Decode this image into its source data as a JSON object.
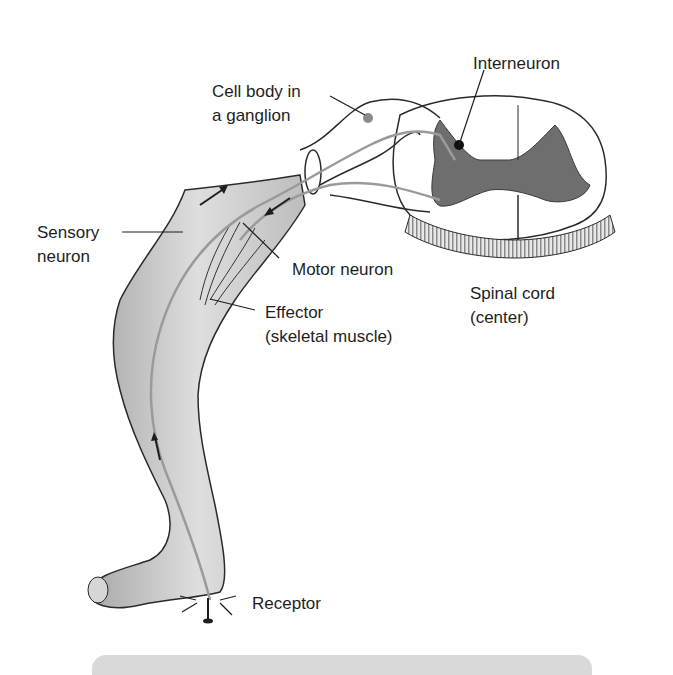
{
  "diagram": {
    "type": "reflex-arc-illustration",
    "labels": {
      "interneuron": "Interneuron",
      "cell_body_line1": "Cell body in",
      "cell_body_line2": "a ganglion",
      "sensory_line1": "Sensory",
      "sensory_line2": "neuron",
      "motor": "Motor neuron",
      "effector_line1": "Effector",
      "effector_line2": "(skeletal muscle)",
      "spinal_line1": "Spinal cord",
      "spinal_line2": "(center)",
      "receptor": "Receptor"
    },
    "colors": {
      "outline": "#2a2a2a",
      "neuron_path": "#9a9a9a",
      "gray_matter": "#6e6e6e",
      "leg_fill": "#cfcfcf",
      "caption_bar": "#d9d9d9"
    },
    "signal_direction": {
      "sensory": "toward spinal cord",
      "motor": "away from spinal cord"
    }
  }
}
